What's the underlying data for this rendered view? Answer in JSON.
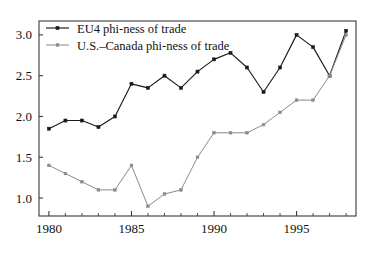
{
  "chart_data": {
    "type": "line",
    "title": "",
    "subtitle": "",
    "xlabel": "",
    "ylabel": "",
    "xlim": [
      1979.4,
      1998.6
    ],
    "ylim": [
      0.78,
      3.17
    ],
    "grid": false,
    "legend_position": "top-left",
    "x": [
      1980,
      1981,
      1982,
      1983,
      1984,
      1985,
      1986,
      1987,
      1988,
      1989,
      1990,
      1991,
      1992,
      1993,
      1994,
      1995,
      1996,
      1997,
      1998
    ],
    "xticks": [
      1980,
      1985,
      1990,
      1995
    ],
    "xtick_labels": [
      "1980",
      "1985",
      "1990",
      "1995"
    ],
    "yticks": [
      1.0,
      1.5,
      2.0,
      2.5,
      3.0
    ],
    "ytick_labels": [
      "1.0",
      "1.5",
      "2.0",
      "2.5",
      "3.0"
    ],
    "series": [
      {
        "name": "EU4 phi-ness of trade",
        "color": "#1a1a1a",
        "marker": "square",
        "values": [
          1.85,
          1.95,
          1.95,
          1.87,
          2.0,
          2.4,
          2.35,
          2.5,
          2.35,
          2.55,
          2.7,
          2.78,
          2.6,
          2.3,
          2.6,
          3.0,
          2.85,
          2.5,
          3.05
        ]
      },
      {
        "name": "U.S.–Canada phi-ness of trade",
        "color": "#8a8a8a",
        "marker": "square",
        "values": [
          1.4,
          1.3,
          1.2,
          1.1,
          1.1,
          1.4,
          0.9,
          1.05,
          1.1,
          1.5,
          1.8,
          1.8,
          1.8,
          1.9,
          2.05,
          2.2,
          2.2,
          2.5,
          3.0
        ]
      }
    ],
    "legend": [
      {
        "label": "EU4 phi-ness of trade",
        "color": "#1a1a1a"
      },
      {
        "label": "U.S.–Canada phi-ness of trade",
        "color": "#8a8a8a"
      }
    ]
  }
}
